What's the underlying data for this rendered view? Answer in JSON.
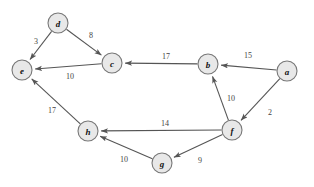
{
  "graph": {
    "type": "directed-weighted-graph",
    "nodes": [
      {
        "id": "a",
        "label": "a",
        "cx": 287,
        "cy": 71,
        "r": 10
      },
      {
        "id": "b",
        "label": "b",
        "cx": 208,
        "cy": 64,
        "r": 10
      },
      {
        "id": "c",
        "label": "c",
        "cx": 112,
        "cy": 63,
        "r": 10
      },
      {
        "id": "d",
        "label": "d",
        "cx": 58,
        "cy": 23,
        "r": 10
      },
      {
        "id": "e",
        "label": "e",
        "cx": 22,
        "cy": 70,
        "r": 10
      },
      {
        "id": "f",
        "label": "f",
        "cx": 232,
        "cy": 130,
        "r": 10
      },
      {
        "id": "g",
        "label": "g",
        "cx": 162,
        "cy": 163,
        "r": 10
      },
      {
        "id": "h",
        "label": "h",
        "cx": 88,
        "cy": 131,
        "r": 10
      }
    ],
    "edges": [
      {
        "id": "d-e",
        "from": "d",
        "to": "e",
        "weight": "3",
        "lx": 36,
        "ly": 41
      },
      {
        "id": "d-c",
        "from": "d",
        "to": "c",
        "weight": "8",
        "lx": 91,
        "ly": 35
      },
      {
        "id": "c-e",
        "from": "c",
        "to": "e",
        "weight": "10",
        "lx": 70,
        "ly": 76
      },
      {
        "id": "b-c",
        "from": "b",
        "to": "c",
        "weight": "17",
        "lx": 166,
        "ly": 56
      },
      {
        "id": "a-b",
        "from": "a",
        "to": "b",
        "weight": "15",
        "lx": 248,
        "ly": 55
      },
      {
        "id": "f-b",
        "from": "f",
        "to": "b",
        "weight": "10",
        "lx": 231,
        "ly": 98
      },
      {
        "id": "a-f",
        "from": "a",
        "to": "f",
        "weight": "2",
        "lx": 270,
        "ly": 112
      },
      {
        "id": "f-h",
        "from": "f",
        "to": "h",
        "weight": "14",
        "lx": 165,
        "ly": 123
      },
      {
        "id": "h-e",
        "from": "h",
        "to": "e",
        "weight": "17",
        "lx": 52,
        "ly": 110
      },
      {
        "id": "f-g",
        "from": "f",
        "to": "g",
        "weight": "9",
        "lx": 200,
        "ly": 160
      },
      {
        "id": "g-h",
        "from": "g",
        "to": "h",
        "weight": "10",
        "lx": 124,
        "ly": 159
      }
    ],
    "colors": {
      "node_fill": "#e8e8e8",
      "node_stroke": "#777777",
      "edge_stroke": "#555555",
      "label_text": "#444444",
      "node_text": "#111111",
      "background": "#ffffff"
    }
  }
}
